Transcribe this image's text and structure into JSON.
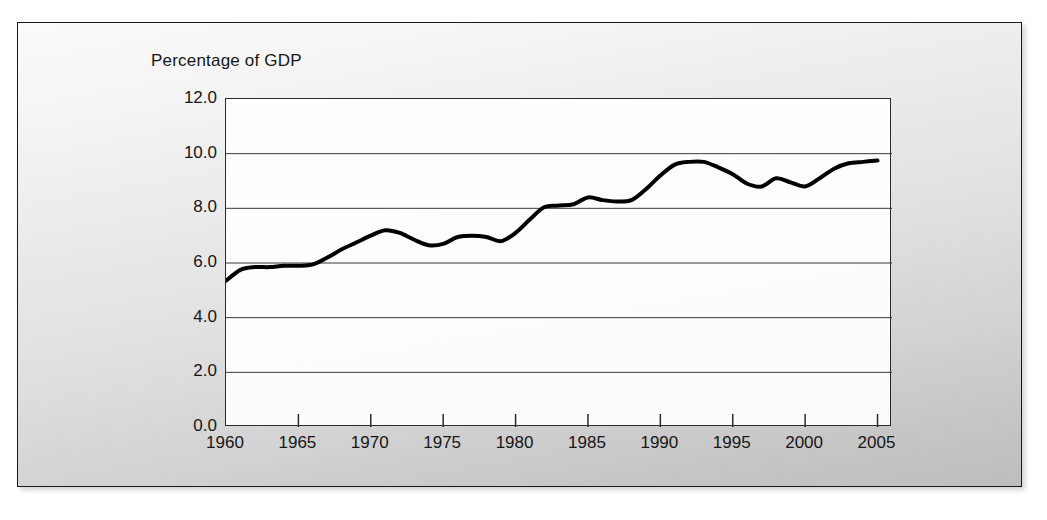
{
  "figure": {
    "axis_title": "Percentage of GDP",
    "background_gradient_from": "#fbfbfb",
    "background_gradient_to": "#bdbdbd",
    "frame_color": "#1a1a1a"
  },
  "chart_data": {
    "type": "line",
    "title": "Percentage of GDP",
    "xlabel": "",
    "ylabel": "Percentage of GDP",
    "xlim": [
      1960,
      2006
    ],
    "ylim": [
      0.0,
      12.0
    ],
    "grid": "horizontal",
    "legend": "none",
    "line_color": "#000000",
    "line_width": 4,
    "y_ticks": [
      "12.0",
      "10.0",
      "8.0",
      "6.0",
      "4.0",
      "2.0",
      "0.0"
    ],
    "y_tick_values": [
      12.0,
      10.0,
      8.0,
      6.0,
      4.0,
      2.0,
      0.0
    ],
    "x_ticks": [
      "1960",
      "1965",
      "1970",
      "1975",
      "1980",
      "1985",
      "1990",
      "1995",
      "2000",
      "2005"
    ],
    "x_tick_values": [
      1960,
      1965,
      1970,
      1975,
      1980,
      1985,
      1990,
      1995,
      2000,
      2005
    ],
    "x": [
      1960,
      1961,
      1962,
      1963,
      1964,
      1965,
      1966,
      1967,
      1968,
      1969,
      1970,
      1971,
      1972,
      1973,
      1974,
      1975,
      1976,
      1977,
      1978,
      1979,
      1980,
      1981,
      1982,
      1983,
      1984,
      1985,
      1986,
      1987,
      1988,
      1989,
      1990,
      1991,
      1992,
      1993,
      1994,
      1995,
      1996,
      1997,
      1998,
      1999,
      2000,
      2001,
      2002,
      2003,
      2004,
      2005
    ],
    "values": [
      5.35,
      5.75,
      5.85,
      5.85,
      5.9,
      5.9,
      5.95,
      6.2,
      6.5,
      6.75,
      7.0,
      7.2,
      7.1,
      6.85,
      6.65,
      6.7,
      6.95,
      7.0,
      6.95,
      6.8,
      7.1,
      7.6,
      8.05,
      8.1,
      8.15,
      8.4,
      8.3,
      8.25,
      8.3,
      8.7,
      9.2,
      9.6,
      9.7,
      9.7,
      9.5,
      9.25,
      8.9,
      8.8,
      9.1,
      8.95,
      8.8,
      9.1,
      9.45,
      9.65,
      9.7,
      9.75
    ],
    "series": [
      {
        "name": "Percentage of GDP",
        "values": [
          5.35,
          5.75,
          5.85,
          5.85,
          5.9,
          5.9,
          5.95,
          6.2,
          6.5,
          6.75,
          7.0,
          7.2,
          7.1,
          6.85,
          6.65,
          6.7,
          6.95,
          7.0,
          6.95,
          6.8,
          7.1,
          7.6,
          8.05,
          8.1,
          8.15,
          8.4,
          8.3,
          8.25,
          8.3,
          8.7,
          9.2,
          9.6,
          9.7,
          9.7,
          9.5,
          9.25,
          8.9,
          8.8,
          9.1,
          8.95,
          8.8,
          9.1,
          9.45,
          9.65,
          9.7,
          9.75
        ]
      }
    ]
  }
}
